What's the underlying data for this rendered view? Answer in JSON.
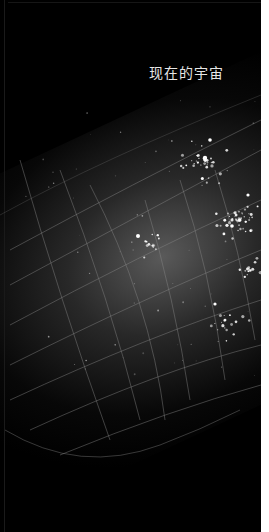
{
  "image": {
    "title_text": "现在的宇宙",
    "description": "Dark starfield with a curved celestial grid and a bright star cluster",
    "colors": {
      "background": "#000000",
      "text": "#e6e6e6",
      "grid": "#8a8a8a",
      "stars": "#ffffff",
      "border": "#ffffff"
    }
  }
}
